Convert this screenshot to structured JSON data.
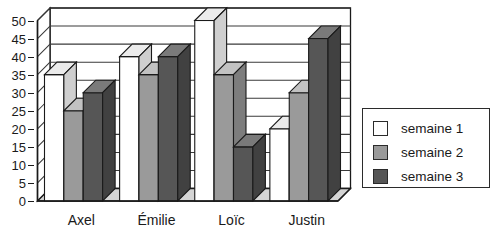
{
  "chart_data": {
    "type": "bar",
    "title": "",
    "xlabel": "",
    "ylabel": "",
    "ylim": [
      0,
      50
    ],
    "ytick_step": 5,
    "yticks": [
      0,
      5,
      10,
      15,
      20,
      25,
      30,
      35,
      40,
      45,
      50
    ],
    "grid": true,
    "three_d": true,
    "legend_position": "right",
    "categories": [
      "Axel",
      "Émilie",
      "Loïc",
      "Justin"
    ],
    "series": [
      {
        "name": "semaine 1",
        "color": "#ffffff",
        "values": [
          35,
          40,
          50,
          20
        ]
      },
      {
        "name": "semaine 2",
        "color": "#9a9a9a",
        "values": [
          25,
          35,
          35,
          30
        ]
      },
      {
        "name": "semaine 3",
        "color": "#565656",
        "values": [
          30,
          40,
          15,
          45
        ]
      }
    ]
  },
  "legend": {
    "items": [
      {
        "label": "semaine 1",
        "color": "#ffffff"
      },
      {
        "label": "semaine 2",
        "color": "#9a9a9a"
      },
      {
        "label": "semaine 3",
        "color": "#565656"
      }
    ]
  },
  "colors": {
    "axis": "#1a1a1a",
    "grid": "#3a3a3a",
    "wall": "#ffffff",
    "floor": "#d4d4d4",
    "series1_face": "#ffffff",
    "series1_top": "#ebebeb",
    "series1_side": "#cfcfcf",
    "series2_face": "#9a9a9a",
    "series2_top": "#c2c2c2",
    "series2_side": "#7d7d7d",
    "series3_face": "#565656",
    "series3_top": "#7a7a7a",
    "series3_side": "#414141",
    "legend_border": "#2b2b2b"
  }
}
